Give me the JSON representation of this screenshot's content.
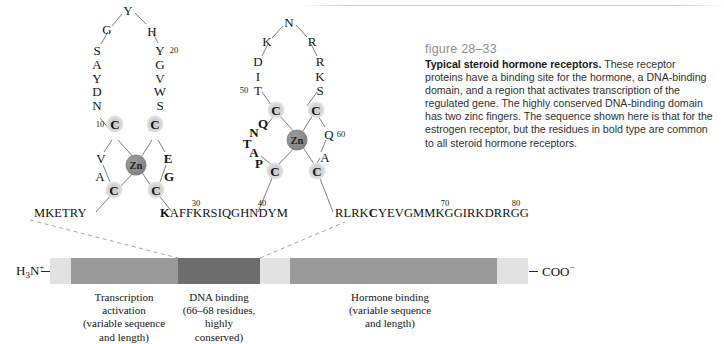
{
  "figure": {
    "number": "figure 28–33",
    "lead": "Typical steroid hormone receptors.",
    "body": " These receptor proteins have a binding site for the hormone, a DNA-binding domain, and a region that activates transcription of the regulated gene. The highly conserved DNA-binding domain has two zinc fingers. The sequence shown here is that for the estrogen receptor, but the residues in bold type are common to all steroid hormone receptors."
  },
  "zinc_fingers": {
    "metal_label": "Zn",
    "finger1": {
      "loop_left": [
        "N",
        "D",
        "Y",
        "A",
        "S",
        "G"
      ],
      "loop_top": "Y",
      "loop_right": [
        "H",
        "Y",
        "G",
        "V",
        "W",
        "S"
      ],
      "cys_top_left": "C",
      "cys_top_right": "C",
      "cys_bot_left": "C",
      "cys_bot_right": "C",
      "lower_left": [
        "V",
        "A"
      ],
      "lower_right": [
        "E",
        "G"
      ],
      "number_10": "10",
      "number_20": "20"
    },
    "finger2": {
      "loop_left": [
        "T",
        "I",
        "D",
        "K"
      ],
      "loop_top": "N",
      "loop_right": [
        "R",
        "R",
        "K",
        "S"
      ],
      "cys_top_left": "C",
      "cys_top_right": "C",
      "cys_bot_left": "C",
      "cys_bot_right": "C",
      "lower_left": [
        "Q",
        "N",
        "T",
        "A",
        "P"
      ],
      "lower_right": [
        "Q",
        "A"
      ],
      "number_50": "50",
      "number_60": "60"
    }
  },
  "sequences": {
    "seq1_plain": "MKETRY",
    "seq2_bold": "K",
    "seq2_plain": "AFFKRSIQGHNDYM",
    "seq3_plain_a": "RLRK",
    "seq3_bold": "C",
    "seq3_plain_b": "YEVGMMKGGIRKDRRGG",
    "number_30": "30",
    "number_40": "40",
    "number_70": "70",
    "number_80": "80"
  },
  "domain_bar": {
    "n_terminus": "H",
    "n_terminus_sub": "3",
    "n_terminus_atom": "N",
    "n_terminus_charge": "+",
    "c_terminus": "COO",
    "c_terminus_charge": "−",
    "segments": [
      {
        "name": "n-cap",
        "color": "#e2e2e2",
        "x": 50,
        "w": 21
      },
      {
        "name": "transcription-activation",
        "color": "#9a9a9a",
        "x": 71,
        "w": 107
      },
      {
        "name": "dna-binding",
        "color": "#6d6d6d",
        "x": 178,
        "w": 82
      },
      {
        "name": "linker",
        "color": "#e2e2e2",
        "x": 260,
        "w": 30
      },
      {
        "name": "hormone-binding",
        "color": "#9a9a9a",
        "x": 290,
        "w": 207
      },
      {
        "name": "c-cap",
        "color": "#e2e2e2",
        "x": 497,
        "w": 31
      }
    ],
    "labels": [
      {
        "name": "transcription-activation-label",
        "cx": 124,
        "lines": [
          "Transcription",
          "activation",
          "(variable sequence",
          "and length)"
        ]
      },
      {
        "name": "dna-binding-label",
        "cx": 219,
        "lines": [
          "DNA binding",
          "(66–68 residues,",
          "highly",
          "conserved)"
        ]
      },
      {
        "name": "hormone-binding-label",
        "cx": 390,
        "lines": [
          "Hormone binding",
          "(variable sequence",
          "and length)"
        ]
      }
    ]
  }
}
